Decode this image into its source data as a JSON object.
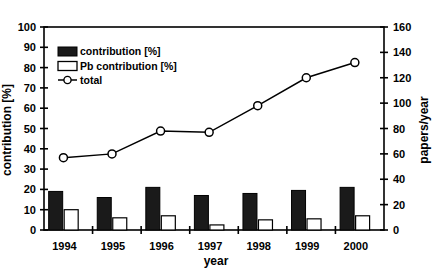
{
  "chart_data": {
    "type": "bar",
    "title": "",
    "subtitle": "",
    "xlabel": "year",
    "ylabel": "contribution [%]",
    "y2label": "papers/year",
    "categories": [
      "1994",
      "1995",
      "1996",
      "1997",
      "1998",
      "1999",
      "2000"
    ],
    "ylim": [
      0,
      100
    ],
    "y2lim": [
      0,
      160
    ],
    "yticks": [
      0,
      10,
      20,
      30,
      40,
      50,
      60,
      70,
      80,
      90,
      100
    ],
    "y2ticks": [
      0,
      20,
      40,
      60,
      80,
      100,
      120,
      140,
      160
    ],
    "grid": false,
    "legend_position": "upper left",
    "series": [
      {
        "name": "contribution [%]",
        "type": "bar",
        "axis": "left",
        "color": "#1a1a1a",
        "fill": "solid-dark",
        "values": [
          19,
          16,
          21,
          17,
          18,
          19.5,
          21
        ]
      },
      {
        "name": "Pb contribution [%]",
        "type": "bar",
        "axis": "left",
        "color": "#ffffff",
        "fill": "white-outline",
        "values": [
          10,
          6,
          7,
          2.5,
          5,
          5.5,
          7
        ]
      },
      {
        "name": "total",
        "type": "line",
        "axis": "right",
        "color": "#000000",
        "marker": "open-circle",
        "values": [
          57,
          60,
          78,
          77,
          98,
          120,
          132
        ]
      }
    ]
  },
  "legend": {
    "items": [
      {
        "label": "contribution [%]",
        "swatch": "dark-bar-swatch"
      },
      {
        "label": "Pb contribution [%]",
        "swatch": "white-bar-swatch"
      },
      {
        "label": "total",
        "swatch": "line-marker-swatch"
      }
    ]
  },
  "axes": {
    "left": {
      "title": "contribution [%]",
      "ticks": [
        "100",
        "90",
        "80",
        "70",
        "60",
        "50",
        "40",
        "30",
        "20",
        "10",
        "0"
      ]
    },
    "right": {
      "title": "papers/year",
      "ticks": [
        "160",
        "140",
        "120",
        "100",
        "80",
        "60",
        "40",
        "20",
        "0"
      ]
    },
    "bottom": {
      "title": "year",
      "ticks": [
        "1994",
        "1995",
        "1996",
        "1997",
        "1998",
        "1999",
        "2000"
      ]
    }
  },
  "colors": {
    "bar_dark": "#1a1a1a",
    "bar_light": "#ffffff",
    "line": "#000000",
    "axis": "#000000",
    "background": "#ffffff"
  }
}
